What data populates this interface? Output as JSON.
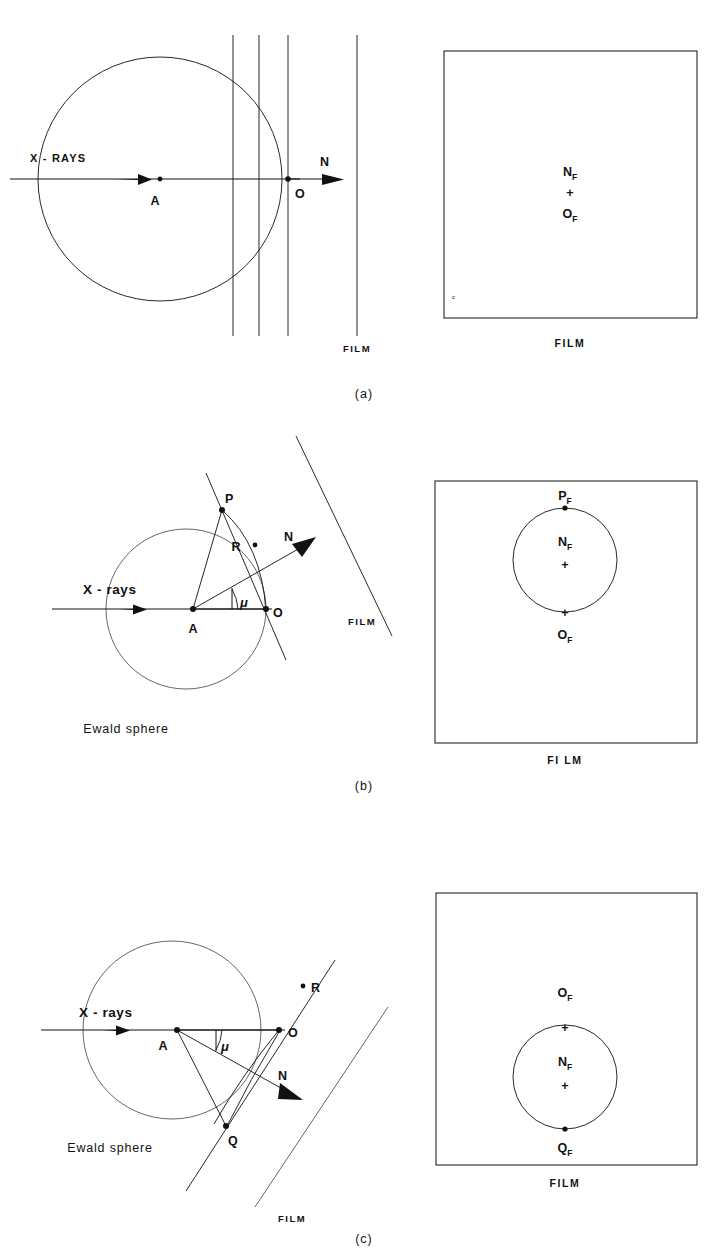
{
  "figure": {
    "type": "crystallography-diagram",
    "background": "#ffffff",
    "ink": "#111111",
    "panels": [
      {
        "id": "a",
        "caption": "(a)",
        "left": {
          "beam_label": "X - RAYS",
          "center_label": "A",
          "origin_label": "O",
          "normal_label": "N",
          "film_label": "FILM",
          "lattice_planes_count": 3,
          "sphere_label": ""
        },
        "right": {
          "film_label": "FILM",
          "marks": [
            {
              "label": "N_F",
              "text": "N",
              "subscript": "F",
              "glyph": ""
            },
            {
              "label": "center-cross",
              "text": "+",
              "subscript": "",
              "glyph": "+"
            },
            {
              "label": "O_F",
              "text": "O",
              "subscript": "F",
              "glyph": ""
            }
          ]
        }
      },
      {
        "id": "b",
        "caption": "(b)",
        "left": {
          "beam_label": "X - rays",
          "center_label": "A",
          "origin_label": "O",
          "normal_label": "N",
          "node_label": "P",
          "reflection_label": "R",
          "angle_label": "μ",
          "sphere_label": "Ewald sphere",
          "film_label": "FILM"
        },
        "right": {
          "film_label": "FI LM",
          "marks": [
            {
              "label": "P_F",
              "text": "P",
              "subscript": "F",
              "glyph": "●"
            },
            {
              "label": "N_F",
              "text": "N",
              "subscript": "F",
              "glyph": "+"
            },
            {
              "label": "O_F",
              "text": "O",
              "subscript": "F",
              "glyph": "+"
            }
          ]
        }
      },
      {
        "id": "c",
        "caption": "(c)",
        "left": {
          "beam_label": "X - rays",
          "center_label": "A",
          "origin_label": "O",
          "normal_label": "N",
          "node_label": "Q",
          "reflection_label": "R",
          "angle_label": "μ",
          "sphere_label": "Ewald sphere",
          "film_label": "FILM"
        },
        "right": {
          "film_label": "FILM",
          "marks": [
            {
              "label": "O_F",
              "text": "O",
              "subscript": "F",
              "glyph": "+"
            },
            {
              "label": "N_F",
              "text": "N",
              "subscript": "F",
              "glyph": "+"
            },
            {
              "label": "Q_F",
              "text": "Q",
              "subscript": "F",
              "glyph": "●"
            }
          ]
        }
      }
    ]
  }
}
